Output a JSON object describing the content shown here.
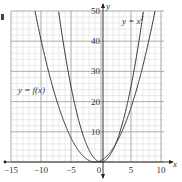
{
  "chart_data": {
    "type": "line",
    "title": "",
    "xlabel": "x",
    "ylabel": "y",
    "xlim": [
      -15,
      10
    ],
    "ylim": [
      0,
      50
    ],
    "grid": true,
    "minor_grid": {
      "x_step": 1,
      "y_step": 2
    },
    "major_grid": {
      "x_step": 5,
      "y_step": 10
    },
    "x_ticks": [
      -15,
      -10,
      -5,
      0,
      5,
      10
    ],
    "x_tick_labels": [
      "−15",
      "−10",
      "−5",
      "0",
      "5",
      "10"
    ],
    "y_ticks": [
      10,
      20,
      30,
      40,
      50
    ],
    "y_tick_labels": [
      "10",
      "20",
      "30",
      "40",
      "50"
    ],
    "series": [
      {
        "name": "y = x²",
        "formula": "x^2",
        "points": [
          [
            -7.07,
            50
          ],
          [
            -6,
            36
          ],
          [
            -4,
            16
          ],
          [
            -2,
            4
          ],
          [
            0,
            0
          ],
          [
            2,
            4
          ],
          [
            4,
            16
          ],
          [
            6,
            36
          ],
          [
            7.07,
            50
          ]
        ]
      },
      {
        "name": "y = f(x)",
        "formula": "0.5*(x+1)^2",
        "points": [
          [
            -11,
            50
          ],
          [
            -9,
            32
          ],
          [
            -7,
            18
          ],
          [
            -5,
            8
          ],
          [
            -3,
            2
          ],
          [
            -1,
            0
          ],
          [
            1,
            2
          ],
          [
            3,
            8
          ],
          [
            5,
            18
          ],
          [
            7,
            32
          ],
          [
            9,
            50
          ]
        ]
      }
    ],
    "annotations": [
      {
        "text": "y = x²",
        "position": "upper right near y=47"
      },
      {
        "text": "y = f(x)",
        "position": "left near y=22"
      }
    ]
  },
  "labels": {
    "x_axis": "x",
    "y_axis": "y",
    "curve_x2": "y = x",
    "curve_x2_sup": "2",
    "curve_f": "y = f(x)"
  }
}
